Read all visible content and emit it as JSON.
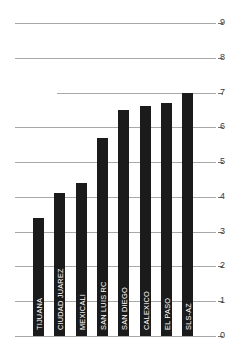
{
  "chart_data": {
    "type": "bar",
    "title": "",
    "subtitle": "",
    "xlabel": "",
    "ylabel": "",
    "categories": [
      "TIJUANA",
      "CIUDAD JUAREZ",
      "MEXICALI",
      "SAN LUIS RC",
      "SAN DIEGO",
      "CALEXICO",
      "EL PASO",
      "SLS-AZ"
    ],
    "values": [
      3.4,
      4.1,
      4.4,
      5.7,
      6.5,
      6.6,
      6.7,
      7.0
    ],
    "ylim": [
      0,
      9
    ],
    "yticks": [
      0,
      1,
      2,
      3,
      4,
      5,
      6,
      7,
      8,
      9
    ],
    "ytick_labels": [
      "0",
      "1",
      "2",
      "3",
      "4",
      "5",
      "6",
      "7",
      "8",
      "9"
    ],
    "grid": true,
    "grid_axis": "y",
    "legend": "none",
    "bar_color": "#1b1b1b",
    "grid_color": "#a8a8a8",
    "label_color": "#ffffff",
    "tick_color": "#3b3b3b",
    "background": "#ffffff",
    "orientation": "vertical",
    "bar_label_rotation": -90
  }
}
